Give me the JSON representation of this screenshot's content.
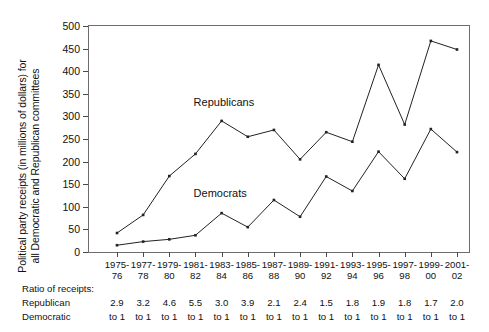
{
  "chart_data": {
    "type": "line",
    "title": "",
    "xlabel": "",
    "ylabel": "Political party receipts (in millions of dollars) for all Democratic and Republican committees",
    "ylabel_lines": [
      "Political party receipts (in millions of dollars) for",
      "all Democratic and Republican committees"
    ],
    "ylim": [
      0,
      500
    ],
    "yticks": [
      0,
      50,
      100,
      150,
      200,
      250,
      300,
      350,
      400,
      450,
      500
    ],
    "ytick_labels": [
      "0",
      "50",
      "100",
      "150",
      "200",
      "250",
      "300",
      "350",
      "400",
      "450",
      "500"
    ],
    "grid": false,
    "legend_position": "inline-annotation",
    "categories": [
      "1975-76",
      "1977-78",
      "1979-80",
      "1981-82",
      "1983-84",
      "1985-86",
      "1987-88",
      "1989-90",
      "1991-92",
      "1993-94",
      "1995-96",
      "1997-98",
      "1999-00",
      "2001-02"
    ],
    "category_lines": [
      [
        "1975-",
        "76"
      ],
      [
        "1977-",
        "78"
      ],
      [
        "1979-",
        "80"
      ],
      [
        "1981-",
        "82"
      ],
      [
        "1983-",
        "84"
      ],
      [
        "1985-",
        "86"
      ],
      [
        "1987-",
        "88"
      ],
      [
        "1989-",
        "90"
      ],
      [
        "1991-",
        "92"
      ],
      [
        "1993-",
        "94"
      ],
      [
        "1995-",
        "96"
      ],
      [
        "1997-",
        "98"
      ],
      [
        "1999-",
        "00"
      ],
      [
        "2001-",
        "02"
      ]
    ],
    "series": [
      {
        "name": "Republicans",
        "color": "#222222",
        "values": [
          42,
          82,
          168,
          217,
          290,
          255,
          270,
          205,
          265,
          244,
          414,
          282,
          467,
          448
        ]
      },
      {
        "name": "Democrats",
        "color": "#222222",
        "values": [
          15,
          23,
          28,
          37,
          86,
          55,
          115,
          78,
          167,
          135,
          222,
          162,
          272,
          221
        ]
      }
    ],
    "annotations": [
      {
        "text": "Republicans",
        "x_index": 4,
        "y_value": 330
      },
      {
        "text": "Democrats",
        "x_index": 4,
        "y_value": 128
      }
    ]
  },
  "ratio_table": {
    "heading": "Ratio of receipts:",
    "row_labels": [
      "Republican",
      "Democratic"
    ],
    "numerator": [
      "2.9",
      "3.2",
      "4.6",
      "5.5",
      "3.0",
      "3.9",
      "2.1",
      "2.4",
      "1.5",
      "1.8",
      "1.9",
      "1.8",
      "1.7",
      "2.0"
    ],
    "denominator": [
      "to 1",
      "to 1",
      "to 1",
      "to 1",
      "to 1",
      "to 1",
      "to 1",
      "to 1",
      "to 1",
      "to 1",
      "to 1",
      "to 1",
      "to 1",
      "to 1"
    ]
  }
}
